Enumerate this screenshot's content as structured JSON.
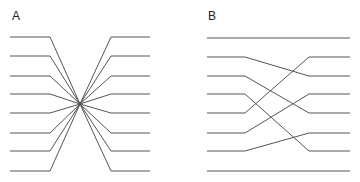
{
  "panels": [
    {
      "label": "A",
      "description": "All lines converge to a single point and fan out (reversed order)",
      "x_start": 10,
      "x_bend_left": 50,
      "x_cross": 80,
      "y_cross": 104,
      "x_bend_right": 111,
      "x_end": 150,
      "rows_y": [
        37,
        56,
        76,
        94,
        113,
        133,
        151,
        171
      ],
      "mapping": [
        7,
        6,
        5,
        4,
        3,
        2,
        1,
        0
      ]
    },
    {
      "label": "B",
      "description": "Permutation of parallel lines with crossings",
      "x_start": 207,
      "x_bend_left": 245,
      "x_bend_right": 309,
      "x_end": 350,
      "rows_y": [
        38,
        57,
        76,
        94,
        113,
        133,
        151,
        171
      ],
      "mapping": [
        0,
        2,
        4,
        6,
        1,
        3,
        5,
        7
      ]
    }
  ],
  "colors": {
    "line": "#555555",
    "label": "#222222",
    "background": "#ffffff"
  }
}
